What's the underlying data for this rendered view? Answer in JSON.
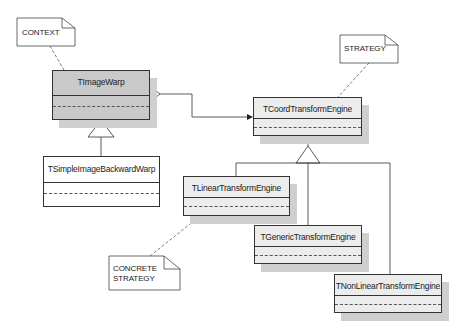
{
  "diagram": {
    "type": "uml-class-diagram",
    "pattern": "Strategy",
    "notes": [
      {
        "id": "context",
        "text": "CONTEXT"
      },
      {
        "id": "strategy",
        "text": "STRATEGY"
      },
      {
        "id": "concrete",
        "lines": [
          "CONCRETE",
          "STRATEGY"
        ]
      }
    ],
    "classes": [
      {
        "id": "image-warp",
        "name": "TImageWarp",
        "role": "context"
      },
      {
        "id": "simple-image-backward-warp",
        "name": "TSimpleImageBackwardWarp",
        "parent": "TImageWarp"
      },
      {
        "id": "coord-transform-engine",
        "name": "TCoordTransformEngine",
        "role": "strategy"
      },
      {
        "id": "linear-transform-engine",
        "name": "TLinearTransformEngine",
        "parent": "TCoordTransformEngine"
      },
      {
        "id": "generic-transform-engine",
        "name": "TGenericTransformEngine",
        "parent": "TCoordTransformEngine"
      },
      {
        "id": "nonlinear-transform-engine",
        "name": "TNonLinearTransformEngine",
        "parent": "TCoordTransformEngine"
      }
    ],
    "relations": [
      {
        "from": "TImageWarp",
        "to": "TCoordTransformEngine",
        "kind": "aggregation"
      },
      {
        "from": "TSimpleImageBackwardWarp",
        "to": "TImageWarp",
        "kind": "generalization"
      },
      {
        "from": "TLinearTransformEngine",
        "to": "TCoordTransformEngine",
        "kind": "generalization"
      },
      {
        "from": "TGenericTransformEngine",
        "to": "TCoordTransformEngine",
        "kind": "generalization"
      },
      {
        "from": "TNonLinearTransformEngine",
        "to": "TCoordTransformEngine",
        "kind": "generalization"
      }
    ]
  }
}
